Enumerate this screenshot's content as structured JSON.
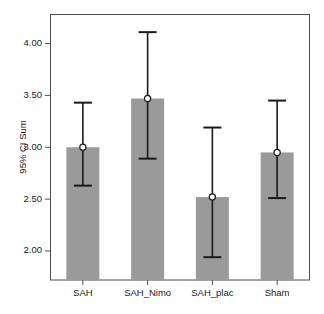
{
  "chart_data": {
    "type": "bar",
    "title": "",
    "subtitle": "",
    "xlabel": "",
    "ylabel": "95% CI Sum",
    "categories": [
      "SAH",
      "SAH_Nimo",
      "SAH_plac",
      "Sham"
    ],
    "values": [
      3.0,
      3.47,
      2.52,
      2.95
    ],
    "error_low": [
      2.63,
      2.89,
      1.94,
      2.51
    ],
    "error_high": [
      3.43,
      4.11,
      3.19,
      3.45
    ],
    "series": [
      {
        "name": "95% CI Sum",
        "values": [
          3.0,
          3.47,
          2.52,
          2.95
        ]
      }
    ],
    "ylim": [
      1.72,
      4.28
    ],
    "yticks": [
      2.0,
      2.5,
      3.0,
      3.5,
      4.0
    ],
    "ytick_labels": [
      "2.00",
      "2.50",
      "3.00",
      "3.50",
      "4.00"
    ],
    "grid": false,
    "legend": false,
    "legend_position": "none",
    "marker": "open-circle",
    "annotations": [],
    "colors": {
      "bar_fill": "#9a9a9a",
      "bar_edge": "#9a9a9a",
      "error_bar": "#1a1a1a",
      "marker_fill": "#ffffff",
      "marker_edge": "#1a1a1a",
      "axis": "#4d4d4d",
      "frame": "#4d4d4d",
      "text": "#1a1a1a",
      "background": "#ffffff"
    }
  }
}
